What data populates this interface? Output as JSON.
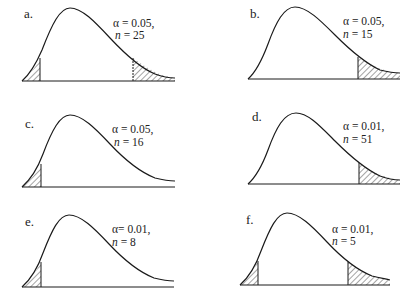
{
  "figure": {
    "panels": [
      {
        "label": "a.",
        "alpha_text": "α = 0.05,",
        "n_label": "n",
        "n_text": " = 25",
        "alpha": 0.05,
        "n": 25,
        "tails": "two-tailed"
      },
      {
        "label": "b.",
        "alpha_text": "α = 0.05,",
        "n_label": "n",
        "n_text": " = 15",
        "alpha": 0.05,
        "n": 15,
        "tails": "right-tailed"
      },
      {
        "label": "c.",
        "alpha_text": "α = 0.05,",
        "n_label": "n",
        "n_text": " = 16",
        "alpha": 0.05,
        "n": 16,
        "tails": "left-tailed"
      },
      {
        "label": "d.",
        "alpha_text": "α = 0.01,",
        "n_label": "n",
        "n_text": " = 51",
        "alpha": 0.01,
        "n": 51,
        "tails": "right-tailed"
      },
      {
        "label": "e.",
        "alpha_text": "α= 0.01,",
        "n_label": "n",
        "n_text": " = 8",
        "alpha": 0.01,
        "n": 8,
        "tails": "left-tailed"
      },
      {
        "label": "f.",
        "alpha_text": "α = 0.01,",
        "n_label": "n",
        "n_text": " = 5",
        "alpha": 0.01,
        "n": 5,
        "tails": "two-tailed"
      }
    ]
  },
  "colors": {
    "ink": "#1a1a1a",
    "background": "#ffffff"
  }
}
